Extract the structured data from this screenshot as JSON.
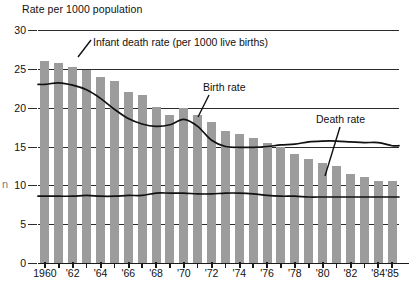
{
  "chart_data": {
    "type": "bar",
    "title": "",
    "ylabel": "Rate per 1000 population",
    "xlabel": "",
    "ylim": [
      0,
      30
    ],
    "yticks": [
      0,
      5,
      10,
      15,
      20,
      25,
      30
    ],
    "grid": true,
    "legend_position": "inline-annotations",
    "x": [
      1960,
      1961,
      1962,
      1963,
      1964,
      1965,
      1966,
      1967,
      1968,
      1969,
      1970,
      1971,
      1972,
      1973,
      1974,
      1975,
      1976,
      1977,
      1978,
      1979,
      1980,
      1981,
      1982,
      1983,
      1984,
      1985
    ],
    "tick_labels": [
      "1960",
      "'62",
      "'64",
      "'66",
      "'68",
      "'70",
      "'72",
      "'74",
      "'76",
      "'78",
      "'80",
      "'82",
      "'84",
      "'85"
    ],
    "tick_label_years": [
      1960,
      1962,
      1964,
      1966,
      1968,
      1970,
      1972,
      1974,
      1976,
      1978,
      1980,
      1982,
      1984,
      1985
    ],
    "series": [
      {
        "name": "Infant death rate (per 1000 live births)",
        "render": "bar",
        "color": "#9c9c9c",
        "values": [
          26.0,
          25.8,
          25.2,
          24.9,
          24.0,
          23.4,
          22.0,
          21.6,
          20.1,
          19.0,
          20.0,
          19.0,
          18.1,
          17.0,
          16.6,
          16.1,
          15.4,
          15.0,
          14.0,
          13.4,
          12.9,
          12.5,
          11.5,
          11.1,
          10.6,
          10.5
        ]
      },
      {
        "name": "Birth rate",
        "render": "line",
        "color": "#111111",
        "values": [
          23.0,
          23.2,
          22.9,
          22.3,
          21.2,
          19.8,
          18.6,
          17.9,
          17.6,
          17.8,
          18.5,
          17.6,
          15.8,
          15.0,
          14.9,
          14.9,
          15.0,
          15.2,
          15.3,
          15.6,
          15.7,
          15.7,
          15.6,
          15.5,
          15.5,
          15.1
        ]
      },
      {
        "name": "Death rate",
        "render": "line",
        "color": "#111111",
        "values": [
          8.6,
          8.6,
          8.6,
          8.7,
          8.6,
          8.6,
          8.7,
          8.7,
          9.0,
          9.0,
          9.0,
          8.9,
          8.9,
          9.0,
          9.0,
          8.9,
          8.7,
          8.6,
          8.6,
          8.5,
          8.5,
          8.5,
          8.5,
          8.5,
          8.5,
          8.5
        ]
      }
    ],
    "annotations": [
      {
        "text": "Infant death rate (per 1000 live births)",
        "target": "bars"
      },
      {
        "text": "Birth rate",
        "target": "birth-rate-curve"
      },
      {
        "text": "Death rate",
        "target": "death-rate-curve"
      }
    ]
  },
  "artifacts": {
    "left_edge_mark": "n"
  }
}
